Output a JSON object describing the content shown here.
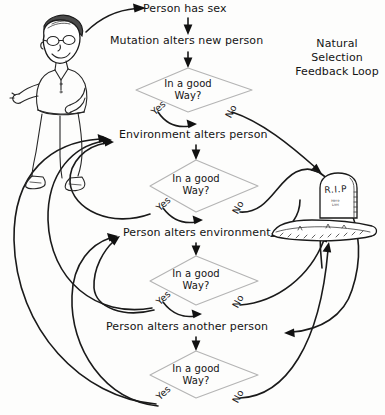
{
  "diagram": {
    "title": "Natural Selection\nFeedback Loop",
    "type": "flowchart",
    "background_color": "#fdfdfc",
    "ink_color": "#1a1a1a",
    "decision_outline_color": "#b4b4b4",
    "style": "hand-drawn sketch",
    "process_steps": [
      {
        "id": "person-has-sex",
        "label": "Person has sex"
      },
      {
        "id": "mutation-alters-new-person",
        "label": "Mutation alters new person"
      },
      {
        "id": "environment-alters-person",
        "label": "Environment alters person"
      },
      {
        "id": "person-alters-environment",
        "label": "Person alters environment"
      },
      {
        "id": "person-alters-another-person",
        "label": "Person alters another person"
      }
    ],
    "decisions": [
      {
        "id": "decision-1",
        "label": "In a good\nWay?",
        "yes_label": "Yes",
        "no_label": "No"
      },
      {
        "id": "decision-2",
        "label": "In a good\nWay?",
        "yes_label": "Yes",
        "no_label": "No"
      },
      {
        "id": "decision-3",
        "label": "In a good\nWay?",
        "yes_label": "Yes",
        "no_label": "No"
      },
      {
        "id": "decision-4",
        "label": "In a good\nWay?",
        "yes_label": "Yes",
        "no_label": "No"
      }
    ],
    "terminal": {
      "id": "grave",
      "label": "R.I.P",
      "sub_label": "Here\nLies",
      "icon": "tombstone-icon"
    },
    "illustration": {
      "id": "cartoon-man",
      "icon": "cartoon-man-icon",
      "description": "hand-drawn man with glasses, dark hair, collared shirt and sneakers"
    }
  }
}
